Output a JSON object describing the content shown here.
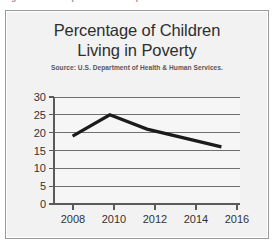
{
  "figure": {
    "caption": "Figure 12.2  Example of a Line Graph."
  },
  "chart_data": {
    "type": "line",
    "title": "Percentage of Children Living in Poverty",
    "title_line1": "Percentage of Children",
    "title_line2": "Living in Poverty",
    "subtitle": "Source: U.S. Department of Health & Human Services.",
    "xlabel": "",
    "ylabel": "",
    "x": [
      2008,
      2010,
      2012,
      2016
    ],
    "values": [
      19,
      25,
      21,
      16
    ],
    "series": [
      {
        "name": "Percentage of children living in poverty",
        "values": [
          19,
          25,
          21,
          16
        ],
        "color": "#1b1b1b"
      }
    ],
    "x_tick_labels": [
      "2008",
      "2010",
      "2012",
      "2014",
      "2016"
    ],
    "x_tick_values": [
      2008,
      2010,
      2012,
      2014,
      2016
    ],
    "y_tick_labels": [
      "0",
      "5",
      "10",
      "15",
      "20",
      "25",
      "30"
    ],
    "y_tick_values": [
      0,
      5,
      10,
      15,
      20,
      25,
      30
    ],
    "xlim": [
      2007,
      2017
    ],
    "ylim": [
      0,
      30
    ],
    "grid": "horizontal",
    "legend": "none",
    "line_color": "#1b1b1b",
    "grid_color": "#6f6f6f",
    "plot_background": "#f6f6f6",
    "figure_background": "#f2f2f2"
  }
}
